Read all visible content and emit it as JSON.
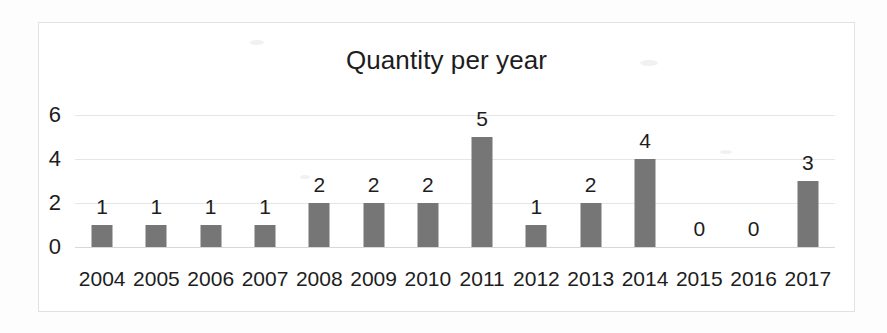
{
  "chart_data": {
    "type": "bar",
    "title": "Quantity per year",
    "xlabel": "",
    "ylabel": "",
    "categories": [
      "2004",
      "2005",
      "2006",
      "2007",
      "2008",
      "2009",
      "2010",
      "2011",
      "2012",
      "2013",
      "2014",
      "2015",
      "2016",
      "2017"
    ],
    "values": [
      1,
      1,
      1,
      1,
      2,
      2,
      2,
      5,
      1,
      2,
      4,
      0,
      0,
      3
    ],
    "data_labels": [
      "1",
      "1",
      "1",
      "1",
      "2",
      "2",
      "2",
      "5",
      "1",
      "2",
      "4",
      "0",
      "0",
      "3"
    ],
    "y_ticks": [
      0,
      2,
      4,
      6
    ],
    "y_tick_labels": [
      "0",
      "2",
      "4",
      "6"
    ],
    "ylim": [
      0,
      6
    ],
    "grid": true,
    "legend": false,
    "legend_position": "none",
    "bar_color": "#767676",
    "gridline_color": "#e6e6e6",
    "text_color": "#1d1d1d",
    "background_color": "#ffffff",
    "border_color": "#e2e2e2"
  }
}
